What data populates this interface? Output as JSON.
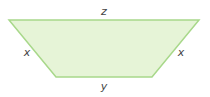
{
  "diagram": {
    "shape": "isosceles-trapezoid",
    "fill_color": "#e6f4d7",
    "stroke_color": "#a8d88a",
    "vertices": {
      "top_left": [
        9,
        20
      ],
      "top_right": [
        199,
        20
      ],
      "bottom_right": [
        152,
        77
      ],
      "bottom_left": [
        56,
        77
      ]
    },
    "labels": {
      "top": "z",
      "bottom": "y",
      "left": "x",
      "right": "x"
    }
  }
}
